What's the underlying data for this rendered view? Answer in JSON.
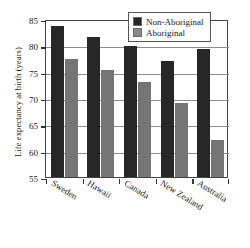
{
  "chart_data": {
    "type": "bar",
    "title": "",
    "xlabel": "",
    "ylabel": "Life expectancy at birth (years)",
    "categories": [
      "Sweden",
      "Hawaii",
      "Canada",
      "New Zealand",
      "Australia"
    ],
    "series": [
      {
        "name": "Non-Aboriginal",
        "color": "#272727",
        "values": [
          83.7,
          81.5,
          79.8,
          77.1,
          79.4
        ]
      },
      {
        "name": "Aboriginal",
        "color": "#757575",
        "values": [
          77.5,
          75.4,
          73.0,
          69.0,
          62.0
        ]
      }
    ],
    "ylim": [
      55,
      85
    ],
    "yticks": [
      85,
      80,
      75,
      70,
      65,
      60,
      55
    ],
    "grid": true,
    "legend_position": "top-right"
  },
  "legend": {
    "items": [
      {
        "label": "Non-Aboriginal",
        "swatch": "dark"
      },
      {
        "label": "Aboriginal",
        "swatch": "light"
      }
    ]
  }
}
